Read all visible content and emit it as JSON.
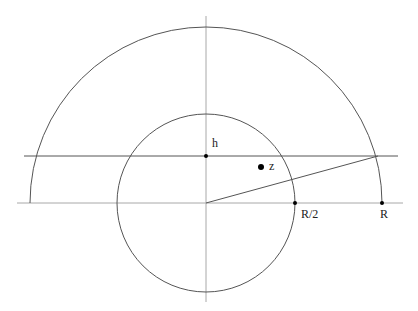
{
  "diagram": {
    "type": "geometry",
    "colors": {
      "stroke": "#555555",
      "axis": "#9a9a9a",
      "point": "#000000",
      "background": "#ffffff"
    },
    "origin": {
      "x": 206,
      "y": 203
    },
    "outer_semicircle": {
      "radius": 176,
      "label": "R"
    },
    "inner_circle": {
      "radius": 89,
      "label": "R/2"
    },
    "horizontal_line_h": {
      "y": 156,
      "label": "h"
    },
    "point_z": {
      "x": 261,
      "y": 167,
      "label": "z"
    },
    "chord_end": {
      "x": 378,
      "y": 156
    }
  },
  "labels": {
    "h": "h",
    "z": "z",
    "r_half": "R/2",
    "r": "R"
  }
}
